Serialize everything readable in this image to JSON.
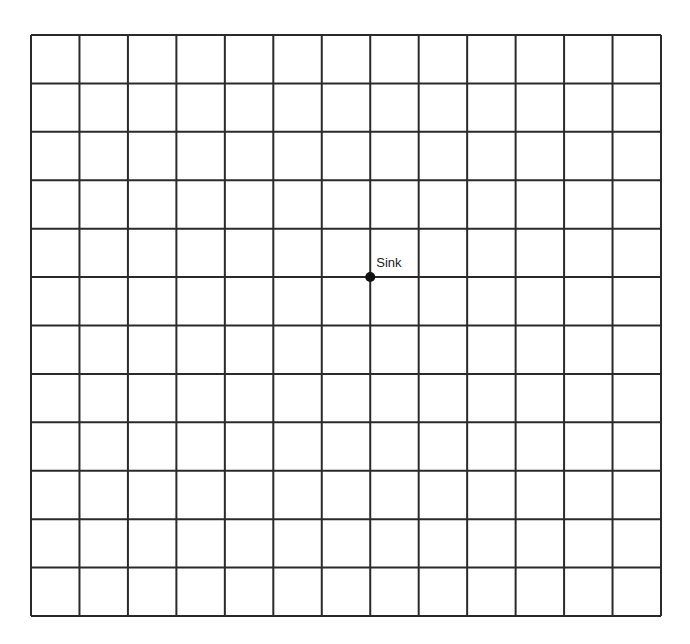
{
  "diagram": {
    "type": "grid",
    "columns": 13,
    "rows": 12,
    "origin": {
      "x": 31,
      "y": 35
    },
    "width": 630,
    "height": 581,
    "line_color": "#2a2a2a",
    "line_width": 2,
    "background": "#ffffff"
  },
  "sink": {
    "label": "Sink",
    "grid_col": 7,
    "grid_row": 5,
    "dot_color": "#111111",
    "dot_radius": 5
  }
}
